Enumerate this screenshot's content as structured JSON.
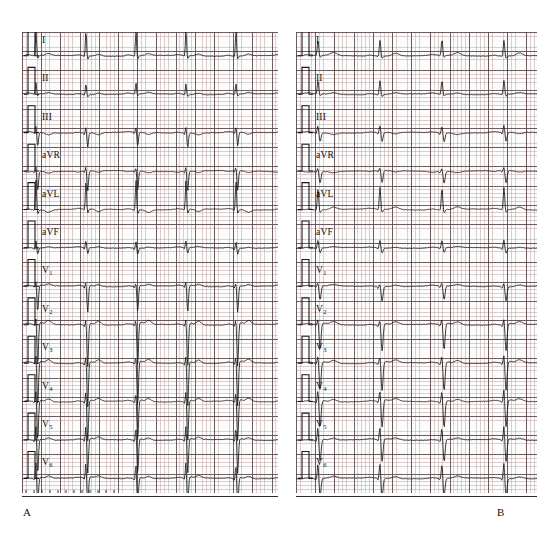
{
  "figure": {
    "type": "12-lead-ecg-comparison",
    "background_color": "#ffffff"
  },
  "colors": {
    "paper": "#fdfcfc",
    "grid_fine": "#c9a9a9",
    "grid_major": "#6b5252",
    "trace": "#1a1a1a",
    "text": "#101010"
  },
  "panels": [
    {
      "id": "A",
      "letter": "A",
      "x": 22,
      "y": 32,
      "width": 256,
      "height": 461,
      "lead_labels": [
        "I",
        "II",
        "III",
        "aVR",
        "aVL",
        "aVF",
        "V1",
        "V2",
        "V3",
        "V4",
        "V5",
        "V6"
      ],
      "calibration_pulse": "1 mV standardization mark at start of each row",
      "beats_visible": 4,
      "note": "High voltage QRS complexes with deep S waves in precordial leads"
    },
    {
      "id": "B",
      "letter": "B",
      "x": 296,
      "y": 32,
      "width": 241,
      "height": 461,
      "lead_labels": [
        "I",
        "II",
        "III",
        "aVR",
        "aVL",
        "aVF",
        "V1",
        "V2",
        "V3",
        "V4",
        "V5",
        "V6"
      ],
      "calibration_pulse": "1 mV standardization mark at start of each row",
      "beats_visible": 3,
      "note": "Lower voltage QRS complexes compared with panel A"
    }
  ],
  "lead_rows": [
    {
      "index": 0,
      "label": "I",
      "subscript": ""
    },
    {
      "index": 1,
      "label": "II",
      "subscript": ""
    },
    {
      "index": 2,
      "label": "III",
      "subscript": ""
    },
    {
      "index": 3,
      "label": "aVR",
      "subscript": ""
    },
    {
      "index": 4,
      "label": "aVL",
      "subscript": ""
    },
    {
      "index": 5,
      "label": "aVF",
      "subscript": ""
    },
    {
      "index": 6,
      "label": "V",
      "subscript": "1"
    },
    {
      "index": 7,
      "label": "V",
      "subscript": "2"
    },
    {
      "index": 8,
      "label": "V",
      "subscript": "3"
    },
    {
      "index": 9,
      "label": "V",
      "subscript": "4"
    },
    {
      "index": 10,
      "label": "V",
      "subscript": "5"
    },
    {
      "index": 11,
      "label": "V",
      "subscript": "6"
    }
  ],
  "chart_data": {
    "type": "line",
    "title": "",
    "xlabel": "Time",
    "ylabel": "Amplitude (mV)",
    "grid": true,
    "legend": "none",
    "paper_speed": "25 mm/s",
    "gain": "10 mm/mV",
    "panels": [
      {
        "panel": "A",
        "beat_interval_px": 50,
        "beat_start_px": 14,
        "series": [
          {
            "lead": "I",
            "r_amp": 26,
            "s_amp": 3,
            "t_amp": 2.0,
            "p_amp": 1.0,
            "baseline_row": 0,
            "morphology": "tall narrow R, small T"
          },
          {
            "lead": "II",
            "r_amp": 11,
            "s_amp": 2,
            "t_amp": 1.5,
            "p_amp": 1.0,
            "baseline_row": 1,
            "morphology": "moderate R"
          },
          {
            "lead": "III",
            "r_amp": 6,
            "s_amp": 14,
            "t_amp": -2.0,
            "p_amp": 0.8,
            "baseline_row": 2,
            "morphology": "rS with inverted T"
          },
          {
            "lead": "aVR",
            "r_amp": 4,
            "s_amp": 20,
            "t_amp": -1.5,
            "p_amp": -0.8,
            "baseline_row": 3,
            "morphology": "deep QS"
          },
          {
            "lead": "aVL",
            "r_amp": 30,
            "s_amp": 4,
            "t_amp": -2.5,
            "p_amp": 0.8,
            "baseline_row": 4,
            "morphology": "very tall R, ST depression"
          },
          {
            "lead": "aVF",
            "r_amp": 7,
            "s_amp": 6,
            "t_amp": 1.0,
            "p_amp": 0.8,
            "baseline_row": 5,
            "morphology": "equiphasic"
          },
          {
            "lead": "V1",
            "r_amp": 4,
            "s_amp": 26,
            "t_amp": 2.0,
            "p_amp": 0.8,
            "baseline_row": 6,
            "morphology": "deep S"
          },
          {
            "lead": "V2",
            "r_amp": 5,
            "s_amp": 42,
            "t_amp": 4.0,
            "p_amp": 0.8,
            "baseline_row": 7,
            "morphology": "very deep S, tall T"
          },
          {
            "lead": "V3",
            "r_amp": 7,
            "s_amp": 44,
            "t_amp": 3.5,
            "p_amp": 0.8,
            "baseline_row": 8,
            "morphology": "very deep S"
          },
          {
            "lead": "V4",
            "r_amp": 10,
            "s_amp": 40,
            "t_amp": 3.0,
            "p_amp": 0.8,
            "baseline_row": 9,
            "morphology": "deep S"
          },
          {
            "lead": "V5",
            "r_amp": 14,
            "s_amp": 34,
            "t_amp": 2.5,
            "p_amp": 0.8,
            "baseline_row": 10,
            "morphology": "deep S"
          },
          {
            "lead": "V6",
            "r_amp": 16,
            "s_amp": 28,
            "t_amp": 2.5,
            "p_amp": 0.8,
            "baseline_row": 11,
            "morphology": "deep S"
          }
        ]
      },
      {
        "panel": "B",
        "beat_interval_px": 62,
        "beat_start_px": 22,
        "series": [
          {
            "lead": "I",
            "r_amp": 16,
            "s_amp": 2,
            "t_amp": 3.0,
            "p_amp": 1.0,
            "baseline_row": 0,
            "morphology": "tall R, prominent T"
          },
          {
            "lead": "II",
            "r_amp": 14,
            "s_amp": 2,
            "t_amp": 1.5,
            "p_amp": 1.0,
            "baseline_row": 1,
            "morphology": "moderate R"
          },
          {
            "lead": "III",
            "r_amp": 7,
            "s_amp": 9,
            "t_amp": -1.5,
            "p_amp": 0.8,
            "baseline_row": 2,
            "morphology": "rS"
          },
          {
            "lead": "aVR",
            "r_amp": 3,
            "s_amp": 12,
            "t_amp": -1.2,
            "p_amp": -0.8,
            "baseline_row": 3,
            "morphology": "QS"
          },
          {
            "lead": "aVL",
            "r_amp": 22,
            "s_amp": 3,
            "t_amp": 2.5,
            "p_amp": 0.8,
            "baseline_row": 4,
            "morphology": "tall R"
          },
          {
            "lead": "aVF",
            "r_amp": 8,
            "s_amp": 5,
            "t_amp": 1.0,
            "p_amp": 0.8,
            "baseline_row": 5,
            "morphology": "equiphasic"
          },
          {
            "lead": "V1",
            "r_amp": 3,
            "s_amp": 14,
            "t_amp": 1.5,
            "p_amp": 0.8,
            "baseline_row": 6,
            "morphology": "rS"
          },
          {
            "lead": "V2",
            "r_amp": 5,
            "s_amp": 26,
            "t_amp": 3.0,
            "p_amp": 0.8,
            "baseline_row": 7,
            "morphology": "deep S"
          },
          {
            "lead": "V3",
            "r_amp": 7,
            "s_amp": 28,
            "t_amp": 3.0,
            "p_amp": 0.8,
            "baseline_row": 8,
            "morphology": "deep S"
          },
          {
            "lead": "V4",
            "r_amp": 11,
            "s_amp": 26,
            "t_amp": 2.5,
            "p_amp": 0.8,
            "baseline_row": 9,
            "morphology": "deep S"
          },
          {
            "lead": "V5",
            "r_amp": 13,
            "s_amp": 22,
            "t_amp": 2.0,
            "p_amp": 0.8,
            "baseline_row": 10,
            "morphology": "deep S"
          },
          {
            "lead": "V6",
            "r_amp": 15,
            "s_amp": 18,
            "t_amp": 2.0,
            "p_amp": 0.8,
            "baseline_row": 11,
            "morphology": "rS"
          }
        ]
      }
    ]
  }
}
